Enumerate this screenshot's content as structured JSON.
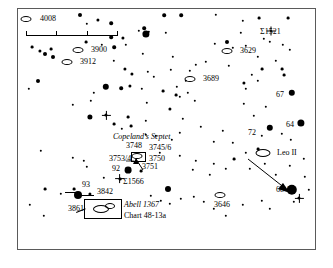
{
  "chart": {
    "title_box": {
      "catalog": "Abell 1367",
      "chart_ref": "Chart 48-13a"
    },
    "group_label": "Copeland's Septet",
    "scale_bar": {
      "ticks": 4
    },
    "frame": {
      "border_color": "#5a5a5a",
      "background": "#ffffff"
    }
  },
  "chart_data": {
    "type": "scatter",
    "xlabel": "",
    "ylabel": "",
    "xlim": [
      0,
      299
    ],
    "ylim": [
      0,
      242
    ],
    "grid": false,
    "legend": "none",
    "galaxy_labels": [
      {
        "id": "4008",
        "text": "4008",
        "x": 22,
        "y": 10,
        "sym_x": 8,
        "sym_y": 10
      },
      {
        "id": "3900",
        "text": "3900",
        "x": 73,
        "y": 41,
        "sym_x": 60,
        "sym_y": 41
      },
      {
        "id": "3912",
        "text": "3912",
        "x": 62,
        "y": 53,
        "sym_x": 49,
        "sym_y": 53
      },
      {
        "id": "3629",
        "text": "3629",
        "x": 222,
        "y": 42,
        "sym_x": 209,
        "sym_y": 42
      },
      {
        "id": "3689",
        "text": "3689",
        "x": 185,
        "y": 70,
        "sym_x": 172,
        "sym_y": 70
      },
      {
        "id": "3646",
        "text": "3646",
        "x": 196,
        "y": 196,
        "sym_x": 202,
        "sym_y": 186
      },
      {
        "id": "LeoII",
        "text": "Leo II",
        "x": 259,
        "y": 144,
        "sym_x": 245,
        "sym_y": 144
      }
    ],
    "star_labels": [
      {
        "id": "S1521",
        "text": "Σ1521",
        "x": 242,
        "y": 23
      },
      {
        "id": "S1566",
        "text": "Σ1566",
        "x": 105,
        "y": 173
      },
      {
        "id": "67",
        "text": "67",
        "x": 258,
        "y": 86
      },
      {
        "id": "64",
        "text": "64",
        "x": 268,
        "y": 116
      },
      {
        "id": "72",
        "text": "72",
        "x": 230,
        "y": 124
      },
      {
        "id": "68d",
        "text": "68-δ",
        "x": 258,
        "y": 181
      },
      {
        "id": "92",
        "text": "92",
        "x": 94,
        "y": 160
      },
      {
        "id": "93",
        "text": "93",
        "x": 64,
        "y": 176
      }
    ],
    "septet_members": [
      {
        "id": "3748",
        "text": "3748",
        "x": 108,
        "y": 137
      },
      {
        "id": "3745/6",
        "text": "3745/6",
        "x": 131,
        "y": 139
      },
      {
        "id": "3753/4",
        "text": "3753/4",
        "x": 91,
        "y": 150
      },
      {
        "id": "3750",
        "text": "3750",
        "x": 131,
        "y": 150
      },
      {
        "id": "3751",
        "text": "3751",
        "x": 124,
        "y": 158
      }
    ],
    "nebula_labels": [
      {
        "id": "3842",
        "text": "3842",
        "x": 79,
        "y": 183
      },
      {
        "id": "3861",
        "text": "3861",
        "x": 50,
        "y": 200
      }
    ],
    "stars": [
      {
        "x": 62,
        "y": 6,
        "r": 2.0
      },
      {
        "x": 80,
        "y": 11,
        "r": 1.6
      },
      {
        "x": 69,
        "y": 15,
        "r": 1.2
      },
      {
        "x": 93,
        "y": 14,
        "r": 1.8
      },
      {
        "x": 146,
        "y": 6,
        "r": 1.8
      },
      {
        "x": 163,
        "y": 6,
        "r": 1.8
      },
      {
        "x": 198,
        "y": 6,
        "r": 1.2
      },
      {
        "x": 241,
        "y": 9,
        "r": 1.4
      },
      {
        "x": 126,
        "y": 19,
        "r": 1.8
      },
      {
        "x": 131,
        "y": 23,
        "r": 1.2
      },
      {
        "x": 93,
        "y": 28,
        "r": 1.8
      },
      {
        "x": 105,
        "y": 29,
        "r": 1.6
      },
      {
        "x": 148,
        "y": 24,
        "r": 1.2
      },
      {
        "x": 223,
        "y": 24,
        "r": 1.2
      },
      {
        "x": 225,
        "y": 12,
        "r": 1.2
      },
      {
        "x": 270,
        "y": 9,
        "r": 1.4
      },
      {
        "x": 253,
        "y": 22,
        "r": 1.0,
        "spike": true
      },
      {
        "x": 128,
        "y": 25,
        "r": 3.6
      },
      {
        "x": 121,
        "y": 22,
        "r": 1.2
      },
      {
        "x": 14,
        "y": 38,
        "r": 1.4
      },
      {
        "x": 22,
        "y": 42,
        "r": 1.6
      },
      {
        "x": 27,
        "y": 45,
        "r": 2.0
      },
      {
        "x": 33,
        "y": 40,
        "r": 1.4
      },
      {
        "x": 35,
        "y": 48,
        "r": 2.0
      },
      {
        "x": 96,
        "y": 38,
        "r": 1.8
      },
      {
        "x": 108,
        "y": 36,
        "r": 1.2
      },
      {
        "x": 84,
        "y": 36,
        "r": 1.2
      },
      {
        "x": 68,
        "y": 33,
        "r": 1.4
      },
      {
        "x": 209,
        "y": 33,
        "r": 2.0
      },
      {
        "x": 215,
        "y": 39,
        "r": 1.2
      },
      {
        "x": 228,
        "y": 37,
        "r": 1.2
      },
      {
        "x": 246,
        "y": 30,
        "r": 1.2
      },
      {
        "x": 252,
        "y": 33,
        "r": 1.2
      },
      {
        "x": 265,
        "y": 36,
        "r": 1.2
      },
      {
        "x": 272,
        "y": 41,
        "r": 1.2
      },
      {
        "x": 197,
        "y": 35,
        "r": 1.2
      },
      {
        "x": 96,
        "y": 52,
        "r": 1.2
      },
      {
        "x": 125,
        "y": 45,
        "r": 1.2
      },
      {
        "x": 155,
        "y": 48,
        "r": 1.2
      },
      {
        "x": 240,
        "y": 48,
        "r": 1.2
      },
      {
        "x": 258,
        "y": 52,
        "r": 1.2
      },
      {
        "x": 244,
        "y": 60,
        "r": 1.4
      },
      {
        "x": 178,
        "y": 56,
        "r": 1.2
      },
      {
        "x": 188,
        "y": 53,
        "r": 1.2
      },
      {
        "x": 211,
        "y": 57,
        "r": 1.2
      },
      {
        "x": 107,
        "y": 60,
        "r": 1.6
      },
      {
        "x": 114,
        "y": 65,
        "r": 1.6
      },
      {
        "x": 130,
        "y": 63,
        "r": 1.2
      },
      {
        "x": 136,
        "y": 68,
        "r": 1.2
      },
      {
        "x": 153,
        "y": 61,
        "r": 1.2
      },
      {
        "x": 172,
        "y": 62,
        "r": 1.2
      },
      {
        "x": 168,
        "y": 72,
        "r": 1.2
      },
      {
        "x": 264,
        "y": 60,
        "r": 1.4
      },
      {
        "x": 266,
        "y": 66,
        "r": 1.4
      },
      {
        "x": 234,
        "y": 66,
        "r": 1.2
      },
      {
        "x": 226,
        "y": 74,
        "r": 1.6
      },
      {
        "x": 228,
        "y": 80,
        "r": 1.2
      },
      {
        "x": 240,
        "y": 72,
        "r": 1.2
      },
      {
        "x": 20,
        "y": 72,
        "r": 2.0
      },
      {
        "x": 11,
        "y": 80,
        "r": 1.2
      },
      {
        "x": 88,
        "y": 78,
        "r": 3.2
      },
      {
        "x": 76,
        "y": 84,
        "r": 1.2
      },
      {
        "x": 103,
        "y": 79,
        "r": 1.8
      },
      {
        "x": 112,
        "y": 77,
        "r": 1.6
      },
      {
        "x": 124,
        "y": 80,
        "r": 1.2
      },
      {
        "x": 145,
        "y": 82,
        "r": 1.4
      },
      {
        "x": 159,
        "y": 78,
        "r": 1.2
      },
      {
        "x": 158,
        "y": 86,
        "r": 1.4
      },
      {
        "x": 162,
        "y": 88,
        "r": 1.2
      },
      {
        "x": 170,
        "y": 84,
        "r": 1.2
      },
      {
        "x": 274,
        "y": 84,
        "r": 3.2
      },
      {
        "x": 226,
        "y": 95,
        "r": 1.2
      },
      {
        "x": 248,
        "y": 98,
        "r": 1.2
      },
      {
        "x": 55,
        "y": 96,
        "r": 1.2
      },
      {
        "x": 73,
        "y": 92,
        "r": 1.2
      },
      {
        "x": 129,
        "y": 94,
        "r": 1.2
      },
      {
        "x": 152,
        "y": 100,
        "r": 1.6
      },
      {
        "x": 177,
        "y": 92,
        "r": 1.2
      },
      {
        "x": 72,
        "y": 108,
        "r": 2.6
      },
      {
        "x": 88,
        "y": 106,
        "r": 1.6,
        "spike": true
      },
      {
        "x": 110,
        "y": 108,
        "r": 1.4
      },
      {
        "x": 128,
        "y": 112,
        "r": 1.2
      },
      {
        "x": 165,
        "y": 110,
        "r": 1.2
      },
      {
        "x": 113,
        "y": 117,
        "r": 1.4
      },
      {
        "x": 96,
        "y": 115,
        "r": 1.4
      },
      {
        "x": 104,
        "y": 120,
        "r": 1.2
      },
      {
        "x": 236,
        "y": 107,
        "r": 1.2
      },
      {
        "x": 283,
        "y": 114,
        "r": 3.6
      },
      {
        "x": 252,
        "y": 119,
        "r": 3.2
      },
      {
        "x": 244,
        "y": 127,
        "r": 1.2
      },
      {
        "x": 264,
        "y": 125,
        "r": 1.2
      },
      {
        "x": 273,
        "y": 131,
        "r": 1.2
      },
      {
        "x": 183,
        "y": 118,
        "r": 1.2
      },
      {
        "x": 205,
        "y": 122,
        "r": 1.2
      },
      {
        "x": 162,
        "y": 124,
        "r": 1.2
      },
      {
        "x": 128,
        "y": 126,
        "r": 1.2
      },
      {
        "x": 138,
        "y": 127,
        "r": 1.2
      },
      {
        "x": 154,
        "y": 131,
        "r": 1.2
      },
      {
        "x": 196,
        "y": 133,
        "r": 1.2
      },
      {
        "x": 215,
        "y": 134,
        "r": 1.2
      },
      {
        "x": 228,
        "y": 144,
        "r": 1.2
      },
      {
        "x": 240,
        "y": 140,
        "r": 1.4
      },
      {
        "x": 216,
        "y": 150,
        "r": 1.4
      },
      {
        "x": 196,
        "y": 155,
        "r": 1.2
      },
      {
        "x": 178,
        "y": 152,
        "r": 1.2
      },
      {
        "x": 162,
        "y": 147,
        "r": 1.2
      },
      {
        "x": 142,
        "y": 144,
        "r": 1.2
      },
      {
        "x": 23,
        "y": 142,
        "r": 1.2
      },
      {
        "x": 55,
        "y": 149,
        "r": 1.2
      },
      {
        "x": 66,
        "y": 152,
        "r": 1.2
      },
      {
        "x": 110,
        "y": 161,
        "r": 3.4
      },
      {
        "x": 123,
        "y": 162,
        "r": 1.4
      },
      {
        "x": 69,
        "y": 158,
        "r": 1.2
      },
      {
        "x": 102,
        "y": 170,
        "r": 1.4,
        "spike": true
      },
      {
        "x": 86,
        "y": 169,
        "r": 1.2
      },
      {
        "x": 175,
        "y": 161,
        "r": 1.2
      },
      {
        "x": 192,
        "y": 166,
        "r": 1.2
      },
      {
        "x": 208,
        "y": 160,
        "r": 1.2
      },
      {
        "x": 232,
        "y": 160,
        "r": 1.2
      },
      {
        "x": 247,
        "y": 155,
        "r": 1.2
      },
      {
        "x": 258,
        "y": 166,
        "r": 1.2
      },
      {
        "x": 272,
        "y": 157,
        "r": 1.2
      },
      {
        "x": 286,
        "y": 150,
        "r": 1.2
      },
      {
        "x": 265,
        "y": 176,
        "r": 1.2
      },
      {
        "x": 274,
        "y": 181,
        "r": 5.2
      },
      {
        "x": 281,
        "y": 189,
        "r": 1.6,
        "spike": true
      },
      {
        "x": 276,
        "y": 193,
        "r": 1.2
      },
      {
        "x": 291,
        "y": 181,
        "r": 1.2
      },
      {
        "x": 287,
        "y": 168,
        "r": 1.2
      },
      {
        "x": 27,
        "y": 180,
        "r": 1.4
      },
      {
        "x": 43,
        "y": 185,
        "r": 1.2
      },
      {
        "x": 56,
        "y": 180,
        "r": 1.4
      },
      {
        "x": 60,
        "y": 186,
        "r": 4.0
      },
      {
        "x": 72,
        "y": 185,
        "r": 1.6
      },
      {
        "x": 150,
        "y": 180,
        "r": 3.0
      },
      {
        "x": 133,
        "y": 187,
        "r": 1.2
      },
      {
        "x": 143,
        "y": 192,
        "r": 1.2
      },
      {
        "x": 152,
        "y": 195,
        "r": 1.2
      },
      {
        "x": 163,
        "y": 190,
        "r": 1.2
      },
      {
        "x": 176,
        "y": 188,
        "r": 1.2
      },
      {
        "x": 186,
        "y": 193,
        "r": 1.2
      },
      {
        "x": 196,
        "y": 200,
        "r": 1.2
      },
      {
        "x": 12,
        "y": 196,
        "r": 1.2
      },
      {
        "x": 26,
        "y": 207,
        "r": 1.2
      },
      {
        "x": 225,
        "y": 196,
        "r": 1.2
      },
      {
        "x": 244,
        "y": 192,
        "r": 1.2
      },
      {
        "x": 252,
        "y": 200,
        "r": 1.2
      },
      {
        "x": 208,
        "y": 207,
        "r": 1.2
      }
    ]
  }
}
